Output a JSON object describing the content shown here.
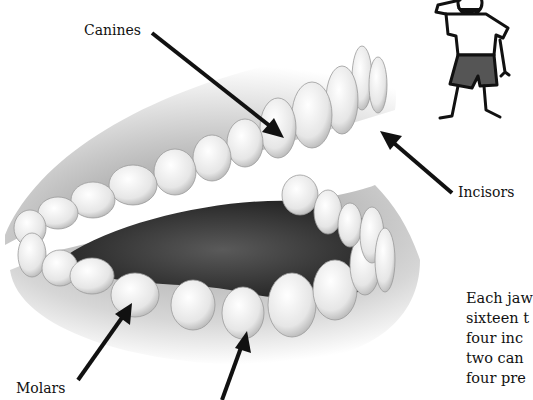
{
  "diagram": {
    "labels": {
      "canines": "Canines",
      "incisors": "Incisors",
      "molars": "Molars"
    },
    "paragraph_lines": [
      "Each jaw",
      "sixteen t",
      "four inc",
      "two can",
      "four pre",
      "  i"
    ],
    "colors": {
      "arrow": "#111111",
      "text": "#111111",
      "tooth": "#f2f2f2",
      "gum": "#bdbdbd",
      "tongue": "#3a3a3a",
      "shorts": "#555555"
    }
  }
}
